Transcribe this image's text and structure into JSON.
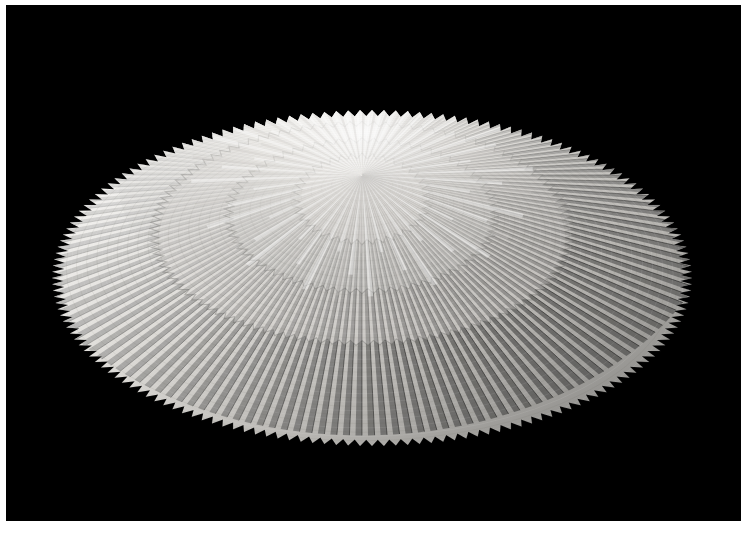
{
  "image": {
    "kind": "photograph",
    "subject": "pleated paper fan sculpture",
    "description": "A white accordion-pleated paper rosette forming a flattened ellipse, photographed against a solid black backdrop with a thin white print border.",
    "background_color": "#000000",
    "border_color": "#ffffff",
    "paper_color": "#f3f1ee",
    "shadow_color": "#6f6e6c",
    "alt_text": "Radially pleated white paper disc, lit from the upper left"
  },
  "canvas": {
    "width": 748,
    "height": 535,
    "border": {
      "left": 6,
      "top": 5,
      "right": 7,
      "bottom": 14
    },
    "field": {
      "x": 6,
      "y": 5,
      "width": 735,
      "height": 516
    }
  },
  "sculpture": {
    "name": "pleated-paper-rosette",
    "center_x": 362,
    "center_y": 175,
    "ellipse_center_x": 372,
    "ellipse_center_y": 278,
    "radius_x": 320,
    "radius_y": 168,
    "outer_teeth": 168,
    "tooth_depth": 9,
    "ray_count": 184,
    "rings": [
      {
        "name": "outer-skirt",
        "rx": 320,
        "ry": 168,
        "tone": "#e9e7e3"
      },
      {
        "name": "mid-terrace",
        "rx": 212,
        "ry": 112,
        "tone": "#dddbd7"
      },
      {
        "name": "inner-terrace",
        "rx": 138,
        "ry": 78,
        "tone": "#d2d0cc"
      },
      {
        "name": "core-burst",
        "rx": 70,
        "ry": 46,
        "tone": "#e4e2de"
      }
    ],
    "lighting": {
      "key_direction": "upper-left",
      "highlight_color": "#fdfdfc",
      "midtone_color": "#c9c7c3",
      "shadow_color": "#5e5d5b",
      "deep_shadow_color": "#343331"
    }
  },
  "labels": {
    "frame": "photo border",
    "field": "black backdrop"
  }
}
